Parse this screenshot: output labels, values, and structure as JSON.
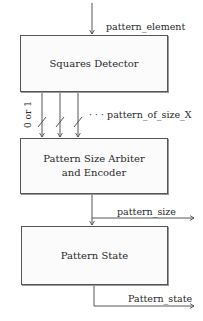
{
  "diagram": {
    "blocks": [
      {
        "id": "squares_detector",
        "label": "Squares Detector"
      },
      {
        "id": "arbiter_encoder",
        "label_line1": "Pattern Size Arbiter",
        "label_line2": "and Encoder"
      },
      {
        "id": "pattern_state",
        "label": "Pattern State"
      }
    ],
    "signals": {
      "input": "pattern_element",
      "bus_width": "0 or 1",
      "bus_label": "· · · pattern_of_size_X",
      "size_out": "pattern_size",
      "state_out": "Pattern_state"
    },
    "colors": {
      "line": "#444444",
      "box_fill": "#fbfbfb",
      "text": "#2a2a2a"
    }
  }
}
